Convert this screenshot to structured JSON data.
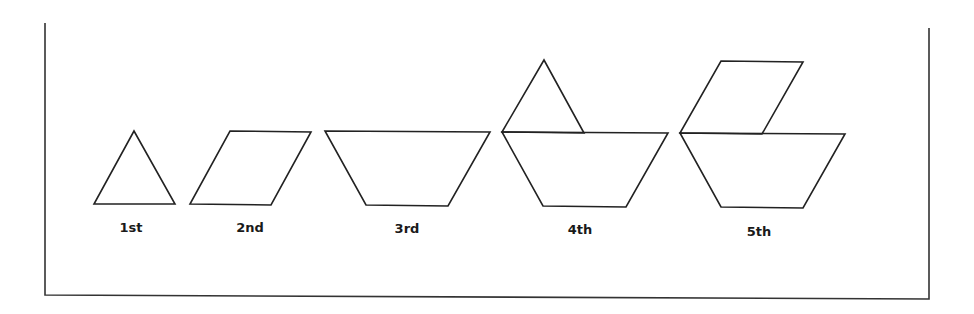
{
  "diagram": {
    "type": "pattern-sequence",
    "colors": {
      "stroke": "#222222",
      "background": "#ffffff",
      "frame": "#333333"
    },
    "figures": [
      {
        "label": "1st",
        "pieces": [
          "triangle"
        ]
      },
      {
        "label": "2nd",
        "pieces": [
          "rhombus"
        ]
      },
      {
        "label": "3rd",
        "pieces": [
          "trapezoid"
        ]
      },
      {
        "label": "4th",
        "pieces": [
          "trapezoid",
          "triangle"
        ]
      },
      {
        "label": "5th",
        "pieces": [
          "trapezoid",
          "rhombus"
        ]
      }
    ]
  }
}
